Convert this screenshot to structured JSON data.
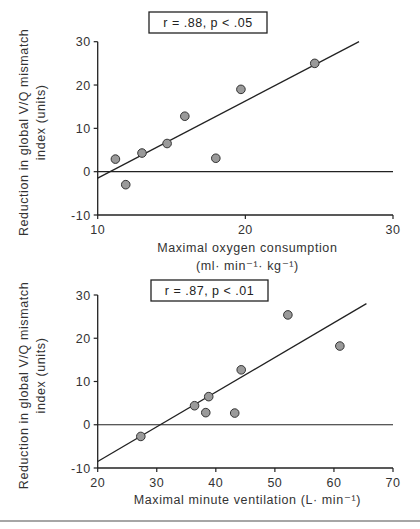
{
  "chart_data": [
    {
      "type": "scatter",
      "title": "",
      "annotation": "r = .88, p < .05",
      "xlabel": "Maximal oxygen consumption",
      "xlabel_units": "(ml· min⁻¹· kg⁻¹)",
      "ylabel": "Reduction in global V/Q mismatch",
      "ylabel_line2": "index (units)",
      "xlim": [
        10,
        30
      ],
      "ylim": [
        -10,
        30
      ],
      "xticks": [
        "10",
        "20",
        "30"
      ],
      "yticks": [
        "30",
        "20",
        "10",
        "0",
        "-10"
      ],
      "grid": false,
      "reference_line_y": 0,
      "points": [
        {
          "x": 11.2,
          "y": 2.9
        },
        {
          "x": 11.9,
          "y": -3.0
        },
        {
          "x": 13.0,
          "y": 4.3
        },
        {
          "x": 14.7,
          "y": 6.5
        },
        {
          "x": 15.9,
          "y": 12.8
        },
        {
          "x": 18.0,
          "y": 3.1
        },
        {
          "x": 19.7,
          "y": 19.0
        },
        {
          "x": 24.7,
          "y": 25.0
        }
      ],
      "fit_line": {
        "x1": 10.0,
        "y1": -1.5,
        "x2": 27.7,
        "y2": 30.0
      }
    },
    {
      "type": "scatter",
      "title": "",
      "annotation": "r = .87, p < .01",
      "xlabel": "Maximal minute ventilation (L· min⁻¹)",
      "ylabel": "Reduction in global V/Q mismatch",
      "ylabel_line2": "index (units)",
      "xlim": [
        20,
        70
      ],
      "ylim": [
        -10,
        30
      ],
      "xticks": [
        "20",
        "30",
        "40",
        "50",
        "60",
        "70"
      ],
      "yticks": [
        "30",
        "20",
        "10",
        "0",
        "-10"
      ],
      "grid": false,
      "reference_line_y": 0,
      "points": [
        {
          "x": 27.3,
          "y": -2.7
        },
        {
          "x": 36.4,
          "y": 4.4
        },
        {
          "x": 38.3,
          "y": 2.8
        },
        {
          "x": 38.8,
          "y": 6.5
        },
        {
          "x": 43.2,
          "y": 2.7
        },
        {
          "x": 44.3,
          "y": 12.7
        },
        {
          "x": 52.2,
          "y": 25.4
        },
        {
          "x": 61.0,
          "y": 18.2
        }
      ],
      "fit_line": {
        "x1": 20.0,
        "y1": -8.5,
        "x2": 65.5,
        "y2": 28.0
      }
    }
  ]
}
